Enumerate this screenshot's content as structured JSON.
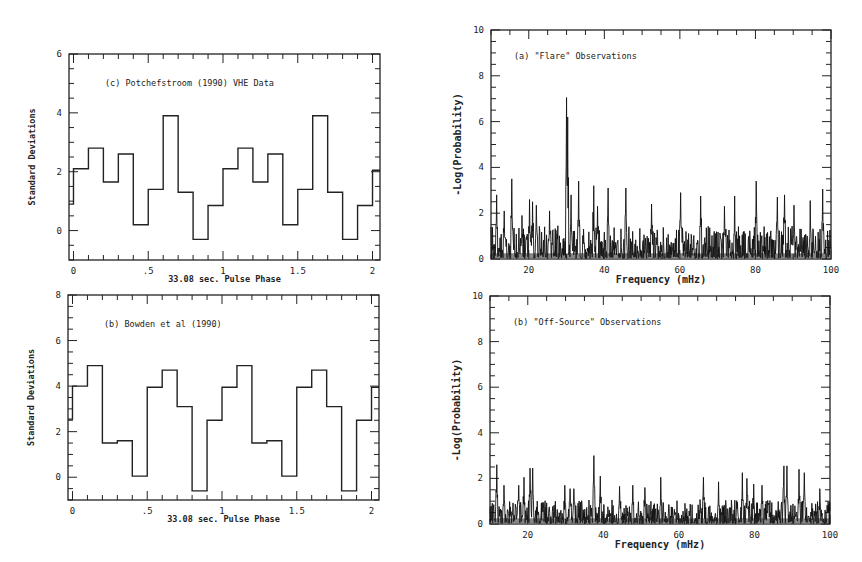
{
  "chart_data": [
    {
      "id": "top-left",
      "type": "line",
      "step": true,
      "title": "(c) Potchefstroom (1990) VHE Data",
      "xlabel": "33.08 sec. Pulse Phase",
      "ylabel": "Standard Deviations",
      "xlim": [
        -0.03,
        2.05
      ],
      "ylim": [
        -1.0,
        6.0
      ],
      "xticks": [
        0,
        0.5,
        1,
        1.5,
        2
      ],
      "xticklabels": [
        "0",
        ".5",
        "1",
        "1.5",
        "2"
      ],
      "yticks": [
        0,
        2,
        4,
        6
      ],
      "yticklabels": [
        "0",
        "2",
        "4",
        "6"
      ],
      "grid": false,
      "bin_edges": [
        -0.03,
        0.0,
        0.1,
        0.2,
        0.3,
        0.4,
        0.5,
        0.6,
        0.7,
        0.8,
        0.9,
        1.0,
        1.1,
        1.2,
        1.3,
        1.4,
        1.5,
        1.6,
        1.7,
        1.8,
        1.9,
        2.0,
        2.05
      ],
      "values": [
        0.9,
        2.1,
        2.8,
        1.65,
        2.6,
        0.2,
        1.4,
        3.9,
        1.3,
        -0.3,
        0.85,
        2.1,
        2.8,
        1.65,
        2.6,
        0.2,
        1.4,
        3.9,
        1.3,
        -0.3,
        0.85,
        2.05
      ]
    },
    {
      "id": "bottom-left",
      "type": "line",
      "step": true,
      "title": "(b) Bowden et al (1990)",
      "xlabel": "33.08 sec. Pulse Phase",
      "ylabel": "Standard Deviations",
      "xlim": [
        -0.03,
        2.05
      ],
      "ylim": [
        -1.0,
        8.0
      ],
      "xticks": [
        0,
        0.5,
        1,
        1.5,
        2
      ],
      "xticklabels": [
        "0",
        ".5",
        "1",
        "1.5",
        "2"
      ],
      "yticks": [
        0,
        2,
        4,
        6,
        8
      ],
      "yticklabels": [
        "0",
        "2",
        "4",
        "6",
        "8"
      ],
      "grid": false,
      "bin_edges": [
        -0.03,
        0.0,
        0.1,
        0.2,
        0.3,
        0.4,
        0.5,
        0.6,
        0.7,
        0.8,
        0.9,
        1.0,
        1.1,
        1.2,
        1.3,
        1.4,
        1.5,
        1.6,
        1.7,
        1.8,
        1.9,
        2.0,
        2.05
      ],
      "values": [
        2.55,
        4.0,
        4.9,
        1.5,
        1.6,
        0.05,
        3.95,
        4.7,
        3.1,
        -0.6,
        2.5,
        3.95,
        4.9,
        1.5,
        1.6,
        0.05,
        3.95,
        4.7,
        3.1,
        -0.6,
        2.5,
        3.95
      ]
    },
    {
      "id": "top-right",
      "type": "line",
      "title": "(a) \"Flare\" Observations",
      "xlabel": "Frequency (mHz)",
      "ylabel": "-Log(Probability)",
      "xlim": [
        10,
        100
      ],
      "ylim": [
        0,
        10
      ],
      "xticks": [
        20,
        40,
        60,
        80,
        100
      ],
      "xticklabels": [
        "20",
        "40",
        "60",
        "80",
        "100"
      ],
      "yticks": [
        0,
        2,
        4,
        6,
        8,
        10
      ],
      "yticklabels": [
        "0",
        "2",
        "4",
        "6",
        "8",
        "10"
      ],
      "grid": false,
      "baseline_noise": {
        "typical": [
          0.1,
          1.2
        ],
        "mean": 0.5
      },
      "peaks": [
        {
          "x": 11.5,
          "y": 2.8
        },
        {
          "x": 13.5,
          "y": 2.1
        },
        {
          "x": 15.5,
          "y": 3.5
        },
        {
          "x": 18.2,
          "y": 1.9
        },
        {
          "x": 20.2,
          "y": 2.6
        },
        {
          "x": 21.0,
          "y": 2.5
        },
        {
          "x": 22.0,
          "y": 2.35
        },
        {
          "x": 25.5,
          "y": 2.1
        },
        {
          "x": 30.0,
          "y": 7.05
        },
        {
          "x": 30.3,
          "y": 6.2
        },
        {
          "x": 31.2,
          "y": 2.8
        },
        {
          "x": 33.2,
          "y": 3.4
        },
        {
          "x": 37.2,
          "y": 3.2
        },
        {
          "x": 38.2,
          "y": 2.3
        },
        {
          "x": 41.0,
          "y": 3.1
        },
        {
          "x": 45.7,
          "y": 3.1
        },
        {
          "x": 52.5,
          "y": 2.4
        },
        {
          "x": 60.2,
          "y": 2.9
        },
        {
          "x": 65.5,
          "y": 2.75
        },
        {
          "x": 71.8,
          "y": 2.3
        },
        {
          "x": 74.5,
          "y": 2.75
        },
        {
          "x": 80.2,
          "y": 3.4
        },
        {
          "x": 85.8,
          "y": 2.7
        },
        {
          "x": 87.7,
          "y": 2.8
        },
        {
          "x": 90.2,
          "y": 2.35
        },
        {
          "x": 94.5,
          "y": 2.55
        },
        {
          "x": 97.8,
          "y": 3.05
        }
      ]
    },
    {
      "id": "bottom-right",
      "type": "line",
      "title": "(b) \"Off-Source\" Observations",
      "xlabel": "Frequency (mHz)",
      "ylabel": "-Log(Probability)",
      "xlim": [
        10,
        100
      ],
      "ylim": [
        0,
        10
      ],
      "xticks": [
        20,
        40,
        60,
        80,
        100
      ],
      "xticklabels": [
        "20",
        "40",
        "60",
        "80",
        "100"
      ],
      "yticks": [
        0,
        2,
        4,
        6,
        8,
        10
      ],
      "yticklabels": [
        "0",
        "2",
        "4",
        "6",
        "8",
        "10"
      ],
      "grid": false,
      "baseline_noise": {
        "typical": [
          0.05,
          0.9
        ],
        "mean": 0.35
      },
      "peaks": [
        {
          "x": 11.8,
          "y": 2.6
        },
        {
          "x": 13.7,
          "y": 1.7
        },
        {
          "x": 17.6,
          "y": 1.7
        },
        {
          "x": 19.0,
          "y": 2.05
        },
        {
          "x": 20.6,
          "y": 2.45
        },
        {
          "x": 21.3,
          "y": 2.45
        },
        {
          "x": 29.8,
          "y": 1.7
        },
        {
          "x": 31.2,
          "y": 1.55
        },
        {
          "x": 32.2,
          "y": 1.55
        },
        {
          "x": 37.5,
          "y": 3.0
        },
        {
          "x": 39.2,
          "y": 2.1
        },
        {
          "x": 44.3,
          "y": 1.65
        },
        {
          "x": 47.8,
          "y": 1.7
        },
        {
          "x": 51.0,
          "y": 1.6
        },
        {
          "x": 55.2,
          "y": 2.05
        },
        {
          "x": 66.5,
          "y": 2.05
        },
        {
          "x": 70.5,
          "y": 1.85
        },
        {
          "x": 76.8,
          "y": 2.25
        },
        {
          "x": 78.0,
          "y": 2.0
        },
        {
          "x": 79.8,
          "y": 1.75
        },
        {
          "x": 82.0,
          "y": 1.7
        },
        {
          "x": 87.8,
          "y": 2.55
        },
        {
          "x": 88.6,
          "y": 2.55
        },
        {
          "x": 91.8,
          "y": 2.4
        },
        {
          "x": 93.2,
          "y": 2.25
        },
        {
          "x": 97.3,
          "y": 1.55
        }
      ]
    }
  ],
  "layout": {
    "panels": [
      {
        "id": "top-left",
        "left": 69,
        "right": 380,
        "top": 54,
        "bottom": 260
      },
      {
        "id": "bottom-left",
        "left": 68,
        "right": 379,
        "top": 295,
        "bottom": 500
      },
      {
        "id": "top-right",
        "left": 491,
        "right": 831,
        "top": 30,
        "bottom": 259
      },
      {
        "id": "bottom-right",
        "left": 490,
        "right": 830,
        "top": 296,
        "bottom": 524
      }
    ]
  }
}
